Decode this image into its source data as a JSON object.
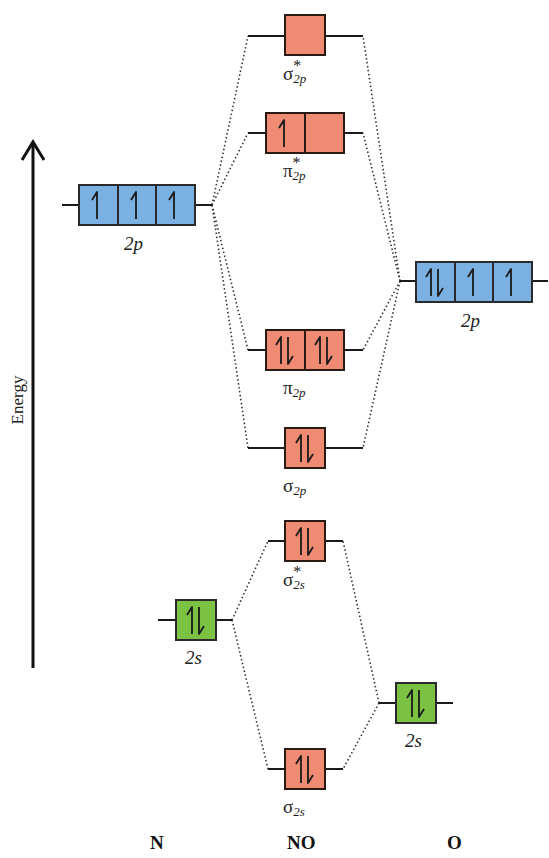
{
  "axis": {
    "label": "Energy",
    "direction": "up"
  },
  "columns": {
    "left": "N",
    "center": "NO",
    "right": "O"
  },
  "colors": {
    "atomic_p": "#7ab0e2",
    "atomic_s": "#7cc242",
    "molecular": "#ef8a73",
    "outline": "#2a1a14",
    "connector": "#333333"
  },
  "atomic_orbitals": {
    "N_2p": {
      "label": "2p",
      "electrons": [
        "up",
        "up",
        "up"
      ]
    },
    "N_2s": {
      "label": "2s",
      "electrons": [
        "pair"
      ]
    },
    "O_2p": {
      "label": "2p",
      "electrons": [
        "pair",
        "up",
        "up"
      ]
    },
    "O_2s": {
      "label": "2s",
      "electrons": [
        "pair"
      ]
    }
  },
  "molecular_orbitals": {
    "sigma_star_2p": {
      "symbol": "σ",
      "star": "*",
      "sub": "2p",
      "electrons": [
        "empty"
      ]
    },
    "pi_star_2p": {
      "symbol": "π",
      "star": "*",
      "sub": "2p",
      "electrons": [
        "up",
        "empty"
      ]
    },
    "pi_2p": {
      "symbol": "π",
      "star": "",
      "sub": "2p",
      "electrons": [
        "pair",
        "pair"
      ]
    },
    "sigma_2p": {
      "symbol": "σ",
      "star": "",
      "sub": "2p",
      "electrons": [
        "pair"
      ]
    },
    "sigma_star_2s": {
      "symbol": "σ",
      "star": "*",
      "sub": "2s",
      "electrons": [
        "pair"
      ]
    },
    "sigma_2s": {
      "symbol": "σ",
      "star": "",
      "sub": "2s",
      "electrons": [
        "pair"
      ]
    }
  }
}
